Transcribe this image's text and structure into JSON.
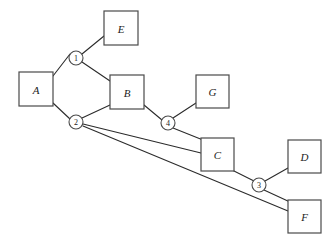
{
  "diagram": {
    "type": "node-link-graph",
    "background_color": "#ffffff",
    "line_color": "#2b2b2b",
    "box_stroke_color": "#4a4a4a",
    "label_color": "#1c1c1c",
    "box_nodes": [
      {
        "id": "E",
        "label": "E",
        "x": 104,
        "y": 11,
        "w": 34,
        "h": 34
      },
      {
        "id": "A",
        "label": "A",
        "x": 19,
        "y": 72,
        "w": 34,
        "h": 34
      },
      {
        "id": "B",
        "label": "B",
        "x": 110,
        "y": 75,
        "w": 34,
        "h": 34
      },
      {
        "id": "G",
        "label": "G",
        "x": 196,
        "y": 75,
        "w": 33,
        "h": 33
      },
      {
        "id": "C",
        "label": "C",
        "x": 201,
        "y": 138,
        "w": 33,
        "h": 33
      },
      {
        "id": "D",
        "label": "D",
        "x": 288,
        "y": 140,
        "w": 33,
        "h": 33
      },
      {
        "id": "F",
        "label": "F",
        "x": 288,
        "y": 200,
        "w": 33,
        "h": 33
      }
    ],
    "circle_nodes": [
      {
        "id": "1",
        "label": "1",
        "cx": 76,
        "cy": 58,
        "r": 7
      },
      {
        "id": "2",
        "label": "2",
        "cx": 76,
        "cy": 122,
        "r": 7
      },
      {
        "id": "3",
        "label": "3",
        "cx": 259,
        "cy": 185,
        "r": 7
      },
      {
        "id": "4",
        "label": "4",
        "cx": 168,
        "cy": 123,
        "r": 7
      }
    ],
    "edges": [
      {
        "id": "A-1",
        "from": "A",
        "to": "1",
        "x1": 53,
        "y1": 76,
        "x2": 70,
        "y2": 54
      },
      {
        "id": "1-E",
        "from": "1",
        "to": "E",
        "x1": 82,
        "y1": 54,
        "x2": 104,
        "y2": 36
      },
      {
        "id": "1-B",
        "from": "1",
        "to": "B",
        "x1": 82,
        "y1": 62,
        "x2": 110,
        "y2": 81
      },
      {
        "id": "A-2",
        "from": "A",
        "to": "2",
        "x1": 53,
        "y1": 103,
        "x2": 70,
        "y2": 119
      },
      {
        "id": "2-B",
        "from": "2",
        "to": "B",
        "x1": 82,
        "y1": 118,
        "x2": 110,
        "y2": 105
      },
      {
        "id": "2-C",
        "from": "2",
        "to": "C",
        "x1": 83,
        "y1": 124,
        "x2": 201,
        "y2": 153
      },
      {
        "id": "2-F",
        "from": "2",
        "to": "F",
        "x1": 83,
        "y1": 126,
        "x2": 288,
        "y2": 211
      },
      {
        "id": "B-4",
        "from": "B",
        "to": "4",
        "x1": 144,
        "y1": 105,
        "x2": 162,
        "y2": 120
      },
      {
        "id": "4-G",
        "from": "4",
        "to": "G",
        "x1": 173,
        "y1": 118,
        "x2": 196,
        "y2": 103
      },
      {
        "id": "4-C",
        "from": "4",
        "to": "C",
        "x1": 173,
        "y1": 128,
        "x2": 203,
        "y2": 140
      },
      {
        "id": "C-3",
        "from": "C",
        "to": "3",
        "x1": 230,
        "y1": 169,
        "x2": 254,
        "y2": 181
      },
      {
        "id": "3-D",
        "from": "3",
        "to": "D",
        "x1": 265,
        "y1": 181,
        "x2": 288,
        "y2": 168
      },
      {
        "id": "3-F",
        "from": "3",
        "to": "F",
        "x1": 264,
        "y1": 190,
        "x2": 290,
        "y2": 202
      }
    ]
  }
}
